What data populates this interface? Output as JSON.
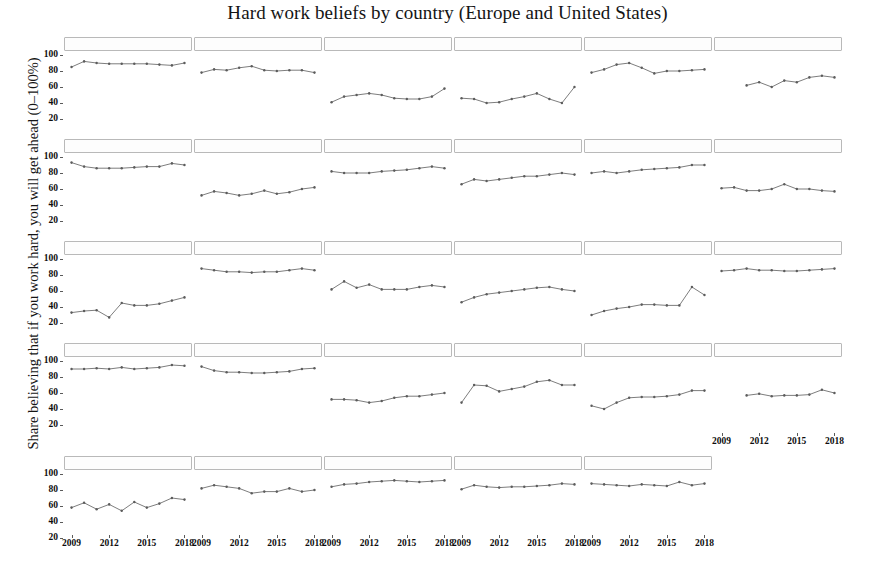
{
  "chart_data": {
    "type": "line",
    "title": "Hard work beliefs by country (Europe and United States)",
    "xlabel": "",
    "ylabel": "Share believing that if you work hard, you will get ahead (0–100%)",
    "ylim": [
      10,
      105
    ],
    "xlim": [
      2008.4,
      2018.6
    ],
    "yticks": [
      20,
      40,
      60,
      80,
      100
    ],
    "xticks": [
      2009,
      2012,
      2015,
      2018
    ],
    "grid": false,
    "legend": null,
    "facet_layout": {
      "rows": 5,
      "cols": 6,
      "panel_count": 29
    },
    "marker": "filled-circle",
    "line_color": "#6e6e6e",
    "marker_color": "#5c5c5c",
    "series": [
      {
        "name": "Austria",
        "row": 1,
        "col": 1,
        "x": [
          2009,
          2010,
          2011,
          2012,
          2013,
          2014,
          2015,
          2016,
          2017,
          2018
        ],
        "values": [
          85,
          92,
          90,
          89,
          89,
          89,
          89,
          88,
          87,
          90
        ]
      },
      {
        "name": "Belgium",
        "row": 1,
        "col": 2,
        "x": [
          2009,
          2010,
          2011,
          2012,
          2013,
          2014,
          2015,
          2016,
          2017,
          2018
        ],
        "values": [
          78,
          82,
          81,
          84,
          86,
          81,
          80,
          81,
          81,
          78
        ]
      },
      {
        "name": "Bulgaria",
        "row": 1,
        "col": 3,
        "x": [
          2009,
          2010,
          2011,
          2012,
          2013,
          2014,
          2015,
          2016,
          2017,
          2018
        ],
        "values": [
          41,
          48,
          50,
          52,
          50,
          46,
          45,
          45,
          48,
          58
        ]
      },
      {
        "name": "Croatia",
        "row": 1,
        "col": 4,
        "x": [
          2009,
          2010,
          2011,
          2012,
          2013,
          2014,
          2015,
          2016,
          2017,
          2018
        ],
        "values": [
          46,
          45,
          40,
          41,
          45,
          48,
          52,
          45,
          40,
          60
        ]
      },
      {
        "name": "Cyprus",
        "row": 1,
        "col": 5,
        "x": [
          2009,
          2010,
          2011,
          2012,
          2013,
          2014,
          2015,
          2016,
          2017,
          2018
        ],
        "values": [
          78,
          82,
          88,
          90,
          84,
          77,
          80,
          80,
          81,
          82
        ]
      },
      {
        "name": "Czech Republic",
        "row": 1,
        "col": 6,
        "x": [
          2011,
          2012,
          2013,
          2014,
          2015,
          2016,
          2017,
          2018
        ],
        "values": [
          62,
          66,
          60,
          68,
          66,
          72,
          74,
          72
        ]
      },
      {
        "name": "Denmark",
        "row": 2,
        "col": 1,
        "x": [
          2009,
          2010,
          2011,
          2012,
          2013,
          2014,
          2015,
          2016,
          2017,
          2018
        ],
        "values": [
          93,
          88,
          86,
          86,
          86,
          87,
          88,
          88,
          92,
          90
        ]
      },
      {
        "name": "Estonia",
        "row": 2,
        "col": 2,
        "x": [
          2009,
          2010,
          2011,
          2012,
          2013,
          2014,
          2015,
          2016,
          2017,
          2018
        ],
        "values": [
          52,
          57,
          55,
          52,
          54,
          58,
          54,
          56,
          60,
          62
        ]
      },
      {
        "name": "Finland",
        "row": 2,
        "col": 3,
        "x": [
          2009,
          2010,
          2011,
          2012,
          2013,
          2014,
          2015,
          2016,
          2017,
          2018
        ],
        "values": [
          82,
          80,
          80,
          80,
          82,
          83,
          84,
          86,
          88,
          86
        ]
      },
      {
        "name": "France",
        "row": 2,
        "col": 4,
        "x": [
          2009,
          2010,
          2011,
          2012,
          2013,
          2014,
          2015,
          2016,
          2017,
          2018
        ],
        "values": [
          66,
          72,
          70,
          72,
          74,
          76,
          76,
          78,
          80,
          78
        ]
      },
      {
        "name": "Germany",
        "row": 2,
        "col": 5,
        "x": [
          2009,
          2010,
          2011,
          2012,
          2013,
          2014,
          2015,
          2016,
          2017,
          2018
        ],
        "values": [
          80,
          82,
          80,
          82,
          84,
          85,
          86,
          87,
          90,
          90
        ]
      },
      {
        "name": "Greece",
        "row": 2,
        "col": 6,
        "x": [
          2009,
          2010,
          2011,
          2012,
          2013,
          2014,
          2015,
          2016,
          2017,
          2018
        ],
        "values": [
          61,
          62,
          58,
          58,
          60,
          66,
          60,
          60,
          58,
          57
        ]
      },
      {
        "name": "Hungary",
        "row": 3,
        "col": 1,
        "x": [
          2009,
          2010,
          2011,
          2012,
          2013,
          2014,
          2015,
          2016,
          2017,
          2018
        ],
        "values": [
          33,
          35,
          36,
          27,
          45,
          42,
          42,
          44,
          48,
          52
        ]
      },
      {
        "name": "Ireland",
        "row": 3,
        "col": 2,
        "x": [
          2009,
          2010,
          2011,
          2012,
          2013,
          2014,
          2015,
          2016,
          2017,
          2018
        ],
        "values": [
          88,
          86,
          84,
          84,
          83,
          84,
          84,
          86,
          88,
          86
        ]
      },
      {
        "name": "Italy",
        "row": 3,
        "col": 3,
        "x": [
          2009,
          2010,
          2011,
          2012,
          2013,
          2014,
          2015,
          2016,
          2017,
          2018
        ],
        "values": [
          62,
          72,
          64,
          68,
          62,
          62,
          62,
          65,
          67,
          65
        ]
      },
      {
        "name": "Latvia",
        "row": 3,
        "col": 4,
        "x": [
          2009,
          2010,
          2011,
          2012,
          2013,
          2014,
          2015,
          2016,
          2017,
          2018
        ],
        "values": [
          46,
          52,
          56,
          58,
          60,
          62,
          64,
          65,
          62,
          60
        ]
      },
      {
        "name": "Lithuania",
        "row": 3,
        "col": 5,
        "x": [
          2009,
          2010,
          2011,
          2012,
          2013,
          2014,
          2015,
          2016,
          2017,
          2018
        ],
        "values": [
          30,
          35,
          38,
          40,
          43,
          43,
          42,
          42,
          65,
          55
        ]
      },
      {
        "name": "Luxembourg",
        "row": 3,
        "col": 6,
        "x": [
          2009,
          2010,
          2011,
          2012,
          2013,
          2014,
          2015,
          2016,
          2017,
          2018
        ],
        "values": [
          85,
          86,
          88,
          86,
          86,
          85,
          85,
          86,
          87,
          88
        ]
      },
      {
        "name": "Malta",
        "row": 4,
        "col": 1,
        "x": [
          2009,
          2010,
          2011,
          2012,
          2013,
          2014,
          2015,
          2016,
          2017,
          2018
        ],
        "values": [
          90,
          90,
          91,
          90,
          92,
          90,
          91,
          92,
          95,
          94
        ]
      },
      {
        "name": "Netherlands",
        "row": 4,
        "col": 2,
        "x": [
          2009,
          2010,
          2011,
          2012,
          2013,
          2014,
          2015,
          2016,
          2017,
          2018
        ],
        "values": [
          93,
          88,
          86,
          86,
          85,
          85,
          86,
          87,
          90,
          91
        ]
      },
      {
        "name": "Poland",
        "row": 4,
        "col": 3,
        "x": [
          2009,
          2010,
          2011,
          2012,
          2013,
          2014,
          2015,
          2016,
          2017,
          2018
        ],
        "values": [
          52,
          52,
          51,
          48,
          50,
          54,
          56,
          56,
          58,
          60
        ]
      },
      {
        "name": "Portugal",
        "row": 4,
        "col": 4,
        "x": [
          2009,
          2010,
          2011,
          2012,
          2013,
          2014,
          2015,
          2016,
          2017,
          2018
        ],
        "values": [
          48,
          70,
          69,
          62,
          65,
          68,
          74,
          76,
          70,
          70
        ]
      },
      {
        "name": "Romania",
        "row": 4,
        "col": 5,
        "x": [
          2009,
          2010,
          2011,
          2012,
          2013,
          2014,
          2015,
          2016,
          2017,
          2018
        ],
        "values": [
          44,
          40,
          48,
          54,
          55,
          55,
          56,
          58,
          63,
          63
        ]
      },
      {
        "name": "Slovakia",
        "row": 4,
        "col": 6,
        "x": [
          2011,
          2012,
          2013,
          2014,
          2015,
          2016,
          2017,
          2018
        ],
        "values": [
          57,
          59,
          56,
          57,
          57,
          58,
          64,
          60
        ]
      },
      {
        "name": "Slovenia",
        "row": 5,
        "col": 1,
        "x": [
          2009,
          2010,
          2011,
          2012,
          2013,
          2014,
          2015,
          2016,
          2017,
          2018
        ],
        "values": [
          58,
          64,
          56,
          62,
          54,
          65,
          58,
          63,
          70,
          68
        ]
      },
      {
        "name": "Spain",
        "row": 5,
        "col": 2,
        "x": [
          2009,
          2010,
          2011,
          2012,
          2013,
          2014,
          2015,
          2016,
          2017,
          2018
        ],
        "values": [
          82,
          86,
          84,
          82,
          76,
          78,
          78,
          82,
          78,
          80
        ]
      },
      {
        "name": "Sweden",
        "row": 5,
        "col": 3,
        "x": [
          2009,
          2010,
          2011,
          2012,
          2013,
          2014,
          2015,
          2016,
          2017,
          2018
        ],
        "values": [
          84,
          87,
          88,
          90,
          91,
          92,
          91,
          90,
          91,
          92
        ]
      },
      {
        "name": "United Kingdom",
        "row": 5,
        "col": 4,
        "x": [
          2009,
          2010,
          2011,
          2012,
          2013,
          2014,
          2015,
          2016,
          2017,
          2018
        ],
        "values": [
          81,
          86,
          84,
          83,
          84,
          84,
          85,
          86,
          88,
          87
        ]
      },
      {
        "name": "United States",
        "row": 5,
        "col": 5,
        "x": [
          2009,
          2010,
          2011,
          2012,
          2013,
          2014,
          2015,
          2016,
          2017,
          2018
        ],
        "values": [
          88,
          87,
          86,
          85,
          87,
          86,
          85,
          90,
          86,
          88
        ]
      }
    ]
  }
}
